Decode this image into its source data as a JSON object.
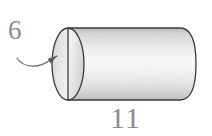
{
  "figure": {
    "type": "geometry-diagram",
    "shape": "cylinder",
    "title": "",
    "background_color": "#ffffff",
    "outline_color": "#3a3a3a",
    "body_fill_color": "#e8e8e8",
    "cap_fill_color": "#dcdcdc",
    "label_color": "#8c8c8c",
    "labels": {
      "radius": {
        "text": "6",
        "refers_to": "cap-radius-line",
        "pointer": "curved-arrow"
      },
      "length": {
        "text": "11",
        "refers_to": "cylinder-length"
      }
    },
    "parts": [
      {
        "name": "cylinder-body",
        "description": "shaded lateral surface"
      },
      {
        "name": "cylinder-cap-ellipse",
        "description": "left circular face drawn as ellipse"
      },
      {
        "name": "cap-radius-line",
        "description": "vertical line through cap center"
      },
      {
        "name": "leader-arrow",
        "description": "curved arrow from label 6 to cap radius line"
      }
    ]
  }
}
